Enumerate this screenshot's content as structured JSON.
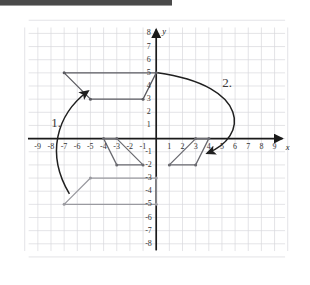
{
  "page": {
    "background_color": "#ffffff",
    "top_bar_color": "#4a4a4a"
  },
  "chart_data": {
    "type": "scatter",
    "title": "",
    "xlabel": "x",
    "ylabel": "y",
    "xlim": [
      -9.8,
      9.8
    ],
    "ylim": [
      -8.6,
      8.6
    ],
    "grid": true,
    "grid_color": "#d8d8dd",
    "axis_color": "#1a1a1a",
    "x_ticks": [
      -9,
      -8,
      -7,
      -6,
      -5,
      -4,
      -3,
      -2,
      -1,
      1,
      2,
      3,
      4,
      5,
      6,
      7,
      8,
      9
    ],
    "x_tick_labels": [
      "-9",
      "-8",
      "-7",
      "-6",
      "-5",
      "-4",
      "-3",
      "-2",
      "-1",
      "1",
      "2",
      "3",
      "4",
      "5",
      "6",
      "7",
      "8",
      "9"
    ],
    "y_ticks": [
      8,
      7,
      6,
      5,
      4,
      3,
      2,
      1,
      -1,
      -2,
      -3,
      -4,
      -5,
      -6,
      -7,
      -8
    ],
    "y_tick_labels": [
      "8",
      "7",
      "6",
      "5",
      "4",
      "3",
      "2",
      "1",
      "-1",
      "-2",
      "-3",
      "-4",
      "-5",
      "-6",
      "-7",
      "-8"
    ],
    "series": [
      {
        "name": "upper-trapezoid",
        "type": "polygon",
        "color": "#5a5a60",
        "closed": true,
        "vertex_markers": true,
        "points": [
          [
            -7,
            5
          ],
          [
            0,
            5
          ],
          [
            -1,
            3
          ],
          [
            -5,
            3
          ]
        ]
      },
      {
        "name": "lower-left-trapezoid",
        "type": "polygon",
        "color": "#9a9aa0",
        "closed": true,
        "vertex_markers": true,
        "points": [
          [
            -7,
            -5
          ],
          [
            0,
            -5
          ],
          [
            0,
            -3
          ],
          [
            -5,
            -3
          ]
        ]
      },
      {
        "name": "left-parallelogram",
        "type": "polygon",
        "color": "#6a6a70",
        "closed": true,
        "vertex_markers": true,
        "points": [
          [
            -4,
            0
          ],
          [
            -3,
            0
          ],
          [
            -1,
            -2
          ],
          [
            -3,
            -2
          ]
        ]
      },
      {
        "name": "right-parallelogram",
        "type": "polygon",
        "color": "#6a6a70",
        "closed": true,
        "vertex_markers": true,
        "points": [
          [
            3,
            0
          ],
          [
            4,
            0
          ],
          [
            3,
            -2
          ],
          [
            1,
            -2
          ]
        ]
      }
    ],
    "annotations": [
      {
        "name": "arrow-1",
        "label": "1.",
        "label_x": -7.6,
        "label_y": 1.2,
        "arrow_from": [
          -6.6,
          -4.2
        ],
        "arrow_to": [
          -5.2,
          3.6
        ],
        "color": "#1f1f1f"
      },
      {
        "name": "arrow-2",
        "label": "2.",
        "label_x": 5.4,
        "label_y": 4.3,
        "arrow_from": [
          0.1,
          5.0
        ],
        "arrow_to": [
          3.9,
          -1.1
        ],
        "color": "#1f1f1f"
      }
    ]
  }
}
